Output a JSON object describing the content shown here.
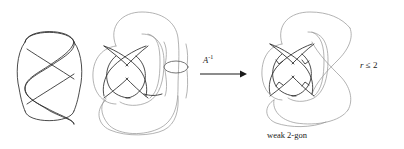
{
  "figure": {
    "background_color": "#ffffff",
    "stroke_colors": {
      "dark": "#2a2a2a",
      "mid": "#555555",
      "light": "#9a9a9a",
      "text": "#1a1a1a"
    }
  },
  "panels": {
    "left": {
      "name": "twisted-loop-diagram",
      "description": "vertical twisted loop with three lobes and two crossings",
      "lobes": 3,
      "crossings": 2
    },
    "middle": {
      "name": "source-knot-diagram",
      "description": "knot diagram with outer loop, inner loops and a small lens-shaped bigon on the right",
      "crossings": 4,
      "has_small_bigon": true
    },
    "right": {
      "name": "target-knot-diagram",
      "description": "knot diagram after applying A inverse, containing a weak 2-gon region",
      "crossings": 4,
      "has_small_bigon": false
    }
  },
  "arrow": {
    "name": "transformation-arrow",
    "direction": "right",
    "label_base": "A",
    "label_exponent": "-1",
    "label_full": "A⁻¹"
  },
  "captions": {
    "weak_2gon": "weak 2-gon",
    "r_bound_var": "r",
    "r_bound_relation": "≤",
    "r_bound_value": "2",
    "r_bound_full": "r ≤ 2"
  }
}
